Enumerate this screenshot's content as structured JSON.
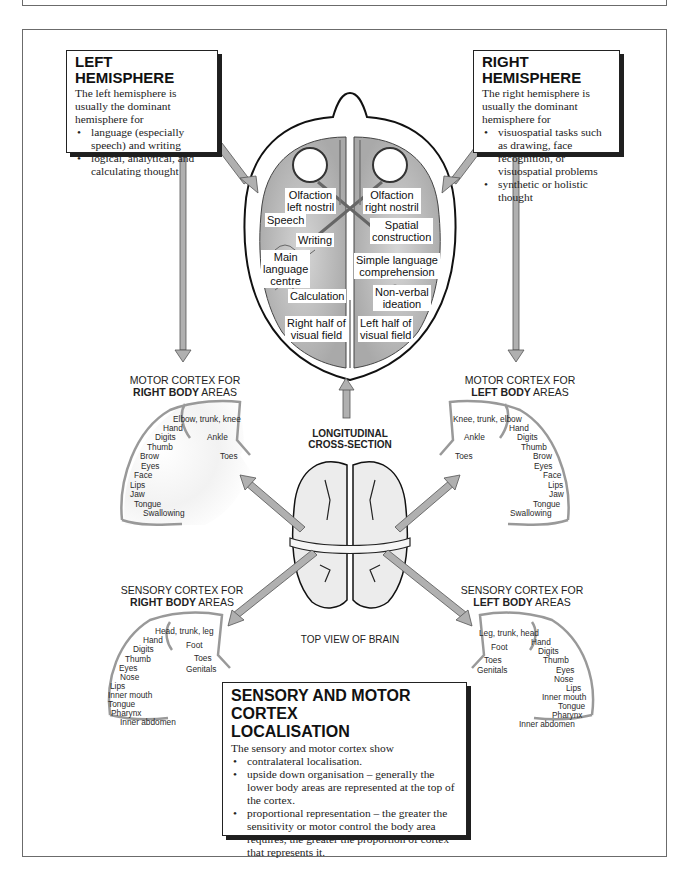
{
  "left_hemisphere": {
    "title": "LEFT HEMISPHERE",
    "intro": "The left hemisphere is usually the dominant hemisphere for",
    "bullets": [
      "language (especially speech) and writing",
      "logical, analytical, and calculating thought"
    ]
  },
  "right_hemisphere": {
    "title": "RIGHT HEMISPHERE",
    "intro": "The right hemisphere is usually the dominant hemisphere for",
    "bullets": [
      "visuospatial tasks such as drawing, face recognition, or visuospatial problems",
      "synthetic or holistic thought"
    ]
  },
  "cross_section": {
    "caption_line1": "LONGITUDINAL",
    "caption_line2": "CROSS-SECTION",
    "regions": {
      "olfaction_left": [
        "Olfaction",
        "left nostril"
      ],
      "olfaction_right": [
        "Olfaction",
        "right nostril"
      ],
      "speech": "Speech",
      "spatial": [
        "Spatial",
        "construction"
      ],
      "writing": "Writing",
      "main_language": [
        "Main",
        "language",
        "centre"
      ],
      "simple_language": [
        "Simple language",
        "comprehension"
      ],
      "calculation": "Calculation",
      "non_verbal": [
        "Non-verbal",
        "ideation"
      ],
      "right_visual": [
        "Right half of",
        "visual field"
      ],
      "left_visual": [
        "Left half of",
        "visual field"
      ]
    }
  },
  "top_view_caption": "TOP VIEW OF BRAIN",
  "motor_right": {
    "title_line1": "MOTOR CORTEX FOR",
    "title_bold": "RIGHT BODY",
    "title_rest": " AREAS",
    "labels": [
      "Elbow, trunk, knee",
      "Hand",
      "Digits",
      "Thumb",
      "Brow",
      "Eyes",
      "Face",
      "Lips",
      "Jaw",
      "Tongue",
      "Swallowing",
      "Ankle",
      "Toes"
    ]
  },
  "motor_left": {
    "title_line1": "MOTOR CORTEX FOR",
    "title_bold": "LEFT BODY",
    "title_rest": " AREAS",
    "labels": [
      "Knee, trunk, elbow",
      "Hand",
      "Digits",
      "Thumb",
      "Brow",
      "Eyes",
      "Face",
      "Lips",
      "Jaw",
      "Tongue",
      "Swallowing",
      "Ankle",
      "Toes"
    ]
  },
  "sensory_right": {
    "title_line1": "SENSORY CORTEX FOR",
    "title_bold": "RIGHT BODY",
    "title_rest": " AREAS",
    "labels": [
      "Head, trunk, leg",
      "Hand",
      "Digits",
      "Thumb",
      "Eyes",
      "Nose",
      "Lips",
      "Inner mouth",
      "Tongue",
      "Pharynx",
      "Inner abdomen",
      "Foot",
      "Toes",
      "Genitals"
    ]
  },
  "sensory_left": {
    "title_line1": "SENSORY CORTEX FOR",
    "title_bold": "LEFT BODY",
    "title_rest": " AREAS",
    "labels": [
      "Leg, trunk, head",
      "Hand",
      "Digits",
      "Thumb",
      "Eyes",
      "Nose",
      "Lips",
      "Inner mouth",
      "Tongue",
      "Pharynx",
      "Inner abdomen",
      "Foot",
      "Toes",
      "Genitals"
    ]
  },
  "localisation": {
    "title_line1": "SENSORY AND MOTOR CORTEX",
    "title_line2": "LOCALISATION",
    "intro": "The sensory and motor cortex show",
    "bullets": [
      "contralateral localisation.",
      "upside down organisation – generally the lower body areas are represented at the top of the cortex.",
      "proportional representation – the greater the sensitivity or motor control the body area requires, the greater the proportion of cortex that represents it."
    ]
  }
}
